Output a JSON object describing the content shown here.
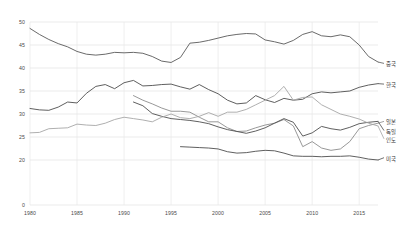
{
  "chart_data": {
    "type": "line",
    "title": "",
    "subtitle": "",
    "xlabel": "",
    "ylabel": "",
    "xlim": [
      1980,
      2017
    ],
    "ylim": [
      0,
      50
    ],
    "grid": true,
    "legend_position": "right-inline",
    "y_ticks": [
      0,
      20,
      25,
      30,
      35,
      40,
      45,
      50
    ],
    "y_tick_labels": [
      "0",
      "20",
      "25",
      "30",
      "35",
      "40",
      "45",
      "50"
    ],
    "x_ticks": [
      1980,
      1985,
      1990,
      1995,
      2000,
      2005,
      2010,
      2015
    ],
    "x_tick_labels": [
      "1980",
      "1985",
      "1990",
      "1995",
      "2000",
      "2005",
      "2010",
      "2015"
    ],
    "axis_break_below": 20,
    "series": [
      {
        "name": "중국",
        "color": "#595959",
        "label_y": 41.0,
        "x": [
          1980,
          1981,
          1982,
          1983,
          1984,
          1985,
          1986,
          1987,
          1988,
          1989,
          1990,
          1991,
          1992,
          1993,
          1994,
          1995,
          1996,
          1997,
          1998,
          1999,
          2000,
          2001,
          2002,
          2003,
          2004,
          2005,
          2006,
          2007,
          2008,
          2009,
          2010,
          2011,
          2012,
          2013,
          2014,
          2015,
          2016,
          2017
        ],
        "values": [
          48.6,
          47.3,
          46.2,
          45.3,
          44.6,
          43.6,
          43.0,
          42.8,
          43.0,
          43.4,
          43.3,
          43.4,
          43.2,
          42.5,
          41.5,
          41.2,
          42.3,
          45.4,
          45.6,
          46.0,
          46.5,
          47.0,
          47.3,
          47.5,
          47.4,
          46.1,
          45.7,
          45.2,
          46.0,
          47.3,
          47.9,
          47.0,
          46.8,
          47.2,
          46.8,
          45.0,
          42.5,
          41.3
        ]
      },
      {
        "name": "한국",
        "color": "#4d4d4d",
        "label_y": 36.5,
        "x": [
          1980,
          1981,
          1982,
          1983,
          1984,
          1985,
          1986,
          1987,
          1988,
          1989,
          1990,
          1991,
          1992,
          1993,
          1994,
          1995,
          1996,
          1997,
          1998,
          1999,
          2000,
          2001,
          2002,
          2003,
          2004,
          2005,
          2006,
          2007,
          2008,
          2009,
          2010,
          2011,
          2012,
          2013,
          2014,
          2015,
          2016,
          2017
        ],
        "values": [
          31.2,
          30.9,
          30.8,
          31.5,
          32.6,
          32.4,
          34.5,
          36.0,
          36.4,
          35.5,
          36.8,
          37.3,
          36.1,
          36.2,
          36.4,
          36.5,
          35.9,
          35.4,
          36.4,
          35.3,
          34.4,
          33.0,
          32.2,
          32.4,
          34.0,
          33.1,
          32.5,
          33.4,
          33.0,
          33.2,
          34.4,
          34.8,
          34.6,
          34.8,
          35.0,
          35.8,
          36.3,
          36.6
        ]
      },
      {
        "name": "일본",
        "color": "#8c8c8c",
        "label_y": 28.4,
        "x": [
          1991,
          1992,
          1993,
          1994,
          1995,
          1996,
          1997,
          1998,
          1999,
          2000,
          2001,
          2002,
          2003,
          2004,
          2005,
          2006,
          2007,
          2008,
          2009,
          2010,
          2011,
          2012,
          2013,
          2014,
          2015,
          2016,
          2017
        ],
        "values": [
          34.0,
          33.0,
          32.2,
          31.3,
          30.6,
          30.6,
          30.4,
          29.3,
          28.3,
          28.3,
          27.0,
          26.2,
          26.3,
          27.0,
          27.6,
          28.0,
          28.8,
          27.4,
          22.9,
          24.0,
          22.6,
          22.1,
          22.4,
          24.0,
          26.8,
          27.5,
          28.0
        ]
      },
      {
        "name": "독일",
        "color": "#4d4d4d",
        "label_y": 26.4,
        "x": [
          1991,
          1992,
          1993,
          1994,
          1995,
          1996,
          1997,
          1998,
          1999,
          2000,
          2001,
          2002,
          2003,
          2004,
          2005,
          2006,
          2007,
          2008,
          2009,
          2010,
          2011,
          2012,
          2013,
          2014,
          2015,
          2016,
          2017
        ],
        "values": [
          32.6,
          31.8,
          30.1,
          29.5,
          29.0,
          28.8,
          28.6,
          28.3,
          27.9,
          27.2,
          26.6,
          26.2,
          25.8,
          26.3,
          27.0,
          28.0,
          29.0,
          28.2,
          25.2,
          25.9,
          27.3,
          26.8,
          26.5,
          27.1,
          27.9,
          28.2,
          28.4
        ]
      },
      {
        "name": "인도",
        "color": "#a6a6a6",
        "label_y": 24.6,
        "x": [
          1980,
          1981,
          1982,
          1983,
          1984,
          1985,
          1986,
          1987,
          1988,
          1989,
          1990,
          1991,
          1992,
          1993,
          1994,
          1995,
          1996,
          1997,
          1998,
          1999,
          2000,
          2001,
          2002,
          2003,
          2004,
          2005,
          2006,
          2007,
          2008,
          2009,
          2010,
          2011,
          2012,
          2013,
          2014,
          2015,
          2016,
          2017
        ],
        "values": [
          25.9,
          26.0,
          26.8,
          26.9,
          27.0,
          27.8,
          27.6,
          27.5,
          28.0,
          28.8,
          29.3,
          29.0,
          28.7,
          28.3,
          29.3,
          30.0,
          29.2,
          29.0,
          29.5,
          30.3,
          29.5,
          30.4,
          30.4,
          31.0,
          32.0,
          33.0,
          34.0,
          36.0,
          33.0,
          33.6,
          33.7,
          32.0,
          31.0,
          30.0,
          29.5,
          28.9,
          28.0,
          27.4
        ]
      },
      {
        "name": "미국",
        "color": "#4d4d4d",
        "label_y": 20.5,
        "x": [
          1996,
          1997,
          1998,
          1999,
          2000,
          2001,
          2002,
          2003,
          2004,
          2005,
          2006,
          2007,
          2008,
          2009,
          2010,
          2011,
          2012,
          2013,
          2014,
          2015,
          2016,
          2017
        ],
        "values": [
          22.9,
          22.8,
          22.7,
          22.6,
          22.4,
          21.8,
          21.5,
          21.6,
          21.9,
          22.1,
          22.0,
          21.5,
          20.9,
          20.8,
          20.8,
          20.7,
          20.8,
          20.8,
          20.9,
          20.6,
          20.2,
          20.0
        ]
      }
    ]
  }
}
